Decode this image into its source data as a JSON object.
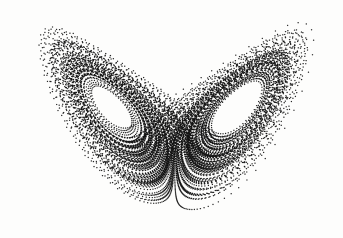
{
  "figure": {
    "title": "Lorenz Attractor",
    "caption_clipped": "Fig. 1  Lorenz attractor",
    "background_color": "#fdfdfc",
    "ink_color": "#111111",
    "width": 343,
    "height": 238
  },
  "chart_data": {
    "type": "scatter",
    "title": "",
    "subtitle": "",
    "xlabel": "",
    "ylabel": "",
    "legend": [],
    "grid": false,
    "axes_visible": false,
    "marker": {
      "style": "dot",
      "size_px": 1.35,
      "color": "#111111",
      "opacity": 0.92
    },
    "projection": "x-z plane of the Lorenz system",
    "system": {
      "name": "Lorenz equations",
      "equations": [
        "dx/dt = sigma*(y - x)",
        "dy/dt = x*(rho - z) - y",
        "dz/dt = x*y - beta*z"
      ],
      "sigma": 10.0,
      "rho": 28.0,
      "beta": 2.6666666667,
      "initial_state": [
        0.9,
        1.4,
        12.0
      ],
      "dt": 0.0042,
      "steps": 34000,
      "burn_in": 900,
      "sample_every": 3
    },
    "xlim": [
      -21.5,
      21.5
    ],
    "zlim": [
      1.0,
      49.0
    ],
    "plot_box_px": {
      "left": 13,
      "top": 8,
      "right": 336,
      "bottom": 224
    },
    "fixed_points": {
      "left_lobe_center_px": [
        97,
        115
      ],
      "right_lobe_center_px": [
        240,
        115
      ],
      "saddle_crossing_px": [
        167,
        128
      ]
    },
    "annotations": []
  }
}
